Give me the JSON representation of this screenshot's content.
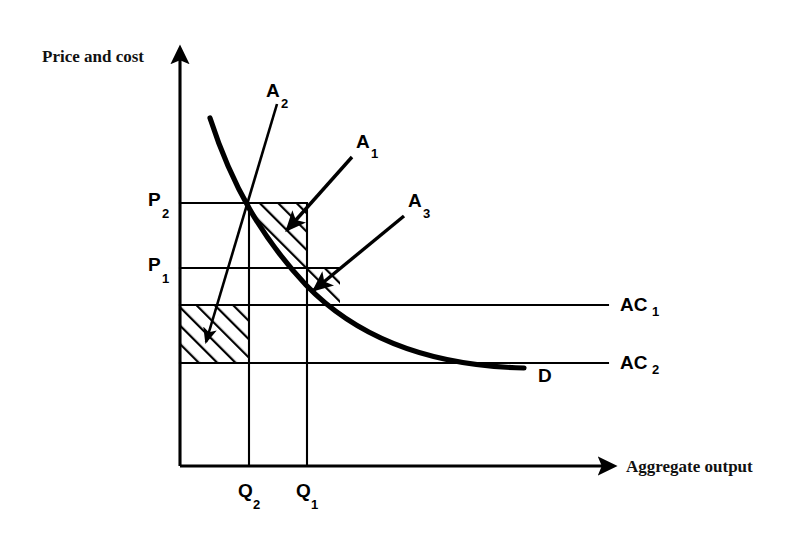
{
  "figure": {
    "kind": "economics-diagram",
    "title": "",
    "background_color": "#ffffff",
    "ink_color": "#000000"
  },
  "axes": {
    "y_label": "Price and cost",
    "x_label": "Aggregate output",
    "origin": {
      "x": 180,
      "y": 466
    },
    "y_axis_top": {
      "x": 180,
      "y": 40
    },
    "x_axis_right": {
      "x": 620,
      "y": 466
    }
  },
  "y_ticks": [
    {
      "label": "P",
      "subscript": "2",
      "y": 203,
      "label_x": 150,
      "label_y": 207
    },
    {
      "label": "P",
      "subscript": "1",
      "y": 268,
      "label_x": 150,
      "label_y": 272
    }
  ],
  "x_ticks": [
    {
      "label": "Q",
      "subscript": "2",
      "x": 249,
      "label_x": 240,
      "label_y": 497
    },
    {
      "label": "Q",
      "subscript": "1",
      "x": 307,
      "label_x": 298,
      "label_y": 497
    }
  ],
  "cost_lines": [
    {
      "label": "AC",
      "subscript": "1",
      "y": 305,
      "x_start": 180,
      "x_end": 608,
      "label_x": 622,
      "label_y": 310
    },
    {
      "label": "AC",
      "subscript": "2",
      "y": 363,
      "x_start": 180,
      "x_end": 608,
      "label_x": 622,
      "label_y": 368
    }
  ],
  "demand_curve": {
    "label": "D",
    "label_x": 543,
    "label_y": 378,
    "path": "M 210 118 C 232 186 262 238 306 285 C 360 341 436 366 524 368",
    "description": "downward sloping convex demand curve"
  },
  "regions": [
    {
      "id": "A1",
      "name": "region-a1",
      "description": "triangle between P2 price line, Q2 vertical and demand curve",
      "hatched": true,
      "path": "M 249 203 L 307 203 L 307 268 L 249 268 Z",
      "clip_note": "clipped by demand curve"
    },
    {
      "id": "A3",
      "name": "region-a3",
      "description": "small sliver right of Q1 under P1 line bounded by demand curve",
      "hatched": true,
      "path": "M 249 268 L 330 268 L 330 305 L 249 305 Z"
    },
    {
      "id": "A2",
      "name": "region-a2",
      "description": "rectangle between AC1 and AC2 from origin to Q2",
      "hatched": true,
      "path": "M 180 305 L 249 305 L 249 363 L 180 363 Z"
    }
  ],
  "annotations": [
    {
      "id": "A2",
      "label": "A",
      "subscript": "2",
      "label_x": 268,
      "label_y": 95,
      "arrow_path": "M 277 104 L 207 338",
      "arrow_tip": {
        "x": 205,
        "y": 345
      },
      "arrow_angle": 107,
      "points_to": "region-a2"
    },
    {
      "id": "A1",
      "label": "A",
      "subscript": "1",
      "label_x": 358,
      "label_y": 146,
      "arrow_path": "M 352 157 L 289 228",
      "arrow_tip": {
        "x": 284,
        "y": 234
      },
      "arrow_angle": 132,
      "points_to": "region-a1"
    },
    {
      "id": "A3",
      "label": "A",
      "subscript": "3",
      "label_x": 410,
      "label_y": 205,
      "arrow_path": "M 404 216 L 316 288",
      "arrow_tip": {
        "x": 310,
        "y": 293
      },
      "arrow_angle": 140,
      "points_to": "region-a3"
    }
  ],
  "grid_segments": [
    {
      "name": "p2-horizontal",
      "x1": 180,
      "y1": 203,
      "x2": 307,
      "y2": 203
    },
    {
      "name": "p1-horizontal",
      "x1": 180,
      "y1": 268,
      "x2": 336,
      "y2": 268
    },
    {
      "name": "q2-vertical",
      "x1": 249,
      "y1": 203,
      "x2": 249,
      "y2": 466
    },
    {
      "name": "q1-vertical",
      "x1": 307,
      "y1": 203,
      "x2": 307,
      "y2": 466
    }
  ]
}
